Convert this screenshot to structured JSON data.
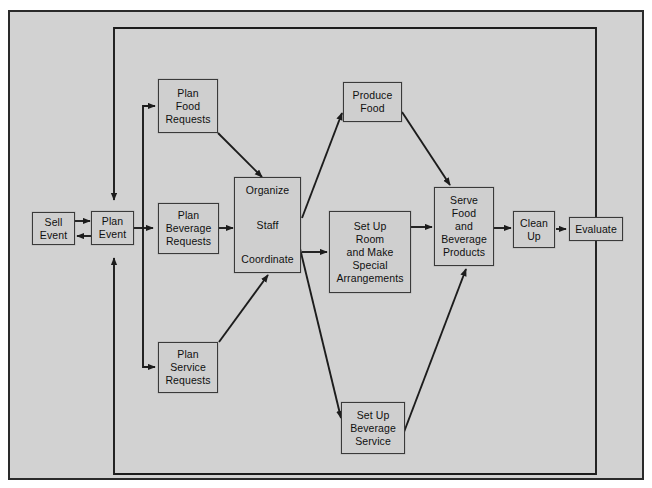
{
  "diagram": {
    "title": "",
    "type": "process-flowchart",
    "colors": {
      "page_background": "#d2d2d2",
      "node_fill": "#cfcfcf",
      "line": "#1c1c1c",
      "border": "#2a2a2a"
    },
    "nodes": [
      {
        "id": "sell-event",
        "lines": [
          "Sell",
          "Event"
        ]
      },
      {
        "id": "plan-event",
        "lines": [
          "Plan",
          "Event"
        ]
      },
      {
        "id": "plan-food-requests",
        "lines": [
          "Plan",
          "Food",
          "Requests"
        ]
      },
      {
        "id": "plan-beverage-requests",
        "lines": [
          "Plan",
          "Beverage",
          "Requests"
        ]
      },
      {
        "id": "plan-service-requests",
        "lines": [
          "Plan",
          "Service",
          "Requests"
        ]
      },
      {
        "id": "organize-staff-coordinate",
        "lines": [
          "Organize",
          "Staff",
          "Coordinate"
        ]
      },
      {
        "id": "produce-food",
        "lines": [
          "Produce",
          "Food"
        ]
      },
      {
        "id": "set-up-room",
        "lines": [
          "Set Up",
          "Room",
          "and Make",
          "Special",
          "Arrangements"
        ]
      },
      {
        "id": "set-up-beverage-service",
        "lines": [
          "Set Up",
          "Beverage",
          "Service"
        ]
      },
      {
        "id": "serve-food-and-beverage-products",
        "lines": [
          "Serve",
          "Food",
          "and",
          "Beverage",
          "Products"
        ]
      },
      {
        "id": "clean-up",
        "lines": [
          "Clean",
          "Up"
        ]
      },
      {
        "id": "evaluate",
        "lines": [
          "Evaluate"
        ]
      }
    ],
    "edges": [
      {
        "from": "sell-event",
        "to": "plan-event"
      },
      {
        "from": "plan-event",
        "to": "sell-event"
      },
      {
        "from": "plan-event",
        "to": "plan-food-requests"
      },
      {
        "from": "plan-event",
        "to": "plan-beverage-requests"
      },
      {
        "from": "plan-event",
        "to": "plan-service-requests"
      },
      {
        "from": "plan-food-requests",
        "to": "organize-staff-coordinate"
      },
      {
        "from": "plan-beverage-requests",
        "to": "organize-staff-coordinate"
      },
      {
        "from": "plan-service-requests",
        "to": "organize-staff-coordinate"
      },
      {
        "from": "organize-staff-coordinate",
        "to": "produce-food"
      },
      {
        "from": "organize-staff-coordinate",
        "to": "set-up-room"
      },
      {
        "from": "organize-staff-coordinate",
        "to": "set-up-beverage-service"
      },
      {
        "from": "produce-food",
        "to": "serve-food-and-beverage-products"
      },
      {
        "from": "set-up-room",
        "to": "serve-food-and-beverage-products"
      },
      {
        "from": "set-up-beverage-service",
        "to": "serve-food-and-beverage-products"
      },
      {
        "from": "serve-food-and-beverage-products",
        "to": "clean-up"
      },
      {
        "from": "clean-up",
        "to": "evaluate"
      },
      {
        "from": "evaluate",
        "to": "plan-event",
        "style": "feedback-loop"
      }
    ]
  }
}
